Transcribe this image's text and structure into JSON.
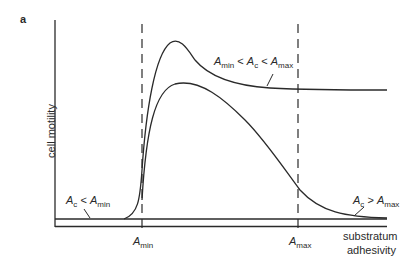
{
  "panel_label": "a",
  "y_axis_label": "cell motility",
  "x_axis_label_line1": "substratum",
  "x_axis_label_line2": "adhesivity",
  "markers": {
    "amin": {
      "sym": "A",
      "sub": "min"
    },
    "amax": {
      "sym": "A",
      "sub": "max"
    }
  },
  "curve_labels": {
    "middle": {
      "a1": "A",
      "s1": "min",
      "op1": " < ",
      "a2": "A",
      "s2": "c",
      "op2": " < ",
      "a3": "A",
      "s3": "max"
    },
    "low": {
      "a1": "A",
      "s1": "c",
      "op1": " < ",
      "a2": "A",
      "s2": "min"
    },
    "high": {
      "a1": "A",
      "s1": "c",
      "op1": " > ",
      "a2": "A",
      "s2": "max"
    }
  },
  "colors": {
    "line": "#2a2a2a",
    "background": "#ffffff"
  }
}
